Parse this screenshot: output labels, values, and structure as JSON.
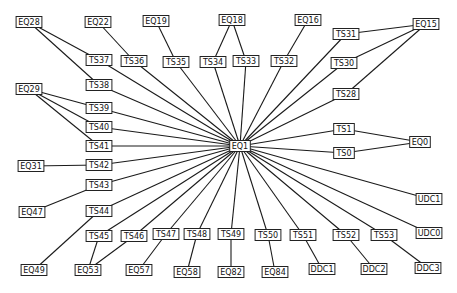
{
  "diagram": {
    "type": "network-topology",
    "center_node": "EQ1",
    "colors": {
      "background": "#ffffff",
      "edge": "#1a1a1a",
      "node_border": "#222222",
      "node_fill": "#ffffff",
      "text": "#111111"
    },
    "nodes": [
      {
        "id": "EQ28",
        "x": 29,
        "y": 22
      },
      {
        "id": "EQ22",
        "x": 98,
        "y": 22
      },
      {
        "id": "EQ19",
        "x": 156,
        "y": 21
      },
      {
        "id": "EQ18",
        "x": 232,
        "y": 20
      },
      {
        "id": "EQ16",
        "x": 308,
        "y": 20
      },
      {
        "id": "EQ15",
        "x": 426,
        "y": 24
      },
      {
        "id": "TS37",
        "x": 99,
        "y": 60
      },
      {
        "id": "TS36",
        "x": 134,
        "y": 61
      },
      {
        "id": "TS35",
        "x": 176,
        "y": 62
      },
      {
        "id": "TS34",
        "x": 213,
        "y": 62
      },
      {
        "id": "TS33",
        "x": 246,
        "y": 61
      },
      {
        "id": "TS32",
        "x": 284,
        "y": 61
      },
      {
        "id": "TS31",
        "x": 346,
        "y": 34
      },
      {
        "id": "TS30",
        "x": 344,
        "y": 63
      },
      {
        "id": "TS28",
        "x": 346,
        "y": 94
      },
      {
        "id": "EQ29",
        "x": 29,
        "y": 89
      },
      {
        "id": "TS38",
        "x": 99,
        "y": 85
      },
      {
        "id": "TS39",
        "x": 99,
        "y": 108
      },
      {
        "id": "TS40",
        "x": 99,
        "y": 127
      },
      {
        "id": "TS41",
        "x": 99,
        "y": 146
      },
      {
        "id": "TS42",
        "x": 99,
        "y": 165
      },
      {
        "id": "EQ31",
        "x": 31,
        "y": 166
      },
      {
        "id": "TS43",
        "x": 99,
        "y": 185
      },
      {
        "id": "EQ1",
        "x": 240,
        "y": 146
      },
      {
        "id": "TS1",
        "x": 344,
        "y": 129
      },
      {
        "id": "TS0",
        "x": 344,
        "y": 153
      },
      {
        "id": "EQ0",
        "x": 420,
        "y": 142
      },
      {
        "id": "EQ47",
        "x": 32,
        "y": 212
      },
      {
        "id": "TS44",
        "x": 99,
        "y": 211
      },
      {
        "id": "UDC1",
        "x": 429,
        "y": 199
      },
      {
        "id": "TS45",
        "x": 99,
        "y": 236
      },
      {
        "id": "TS46",
        "x": 134,
        "y": 236
      },
      {
        "id": "TS47",
        "x": 166,
        "y": 234
      },
      {
        "id": "TS48",
        "x": 197,
        "y": 234
      },
      {
        "id": "TS49",
        "x": 231,
        "y": 234
      },
      {
        "id": "TS50",
        "x": 268,
        "y": 235
      },
      {
        "id": "TS51",
        "x": 303,
        "y": 235
      },
      {
        "id": "TS52",
        "x": 346,
        "y": 235
      },
      {
        "id": "TS53",
        "x": 384,
        "y": 235
      },
      {
        "id": "UDC0",
        "x": 429,
        "y": 233
      },
      {
        "id": "EQ49",
        "x": 34,
        "y": 270
      },
      {
        "id": "EQ53",
        "x": 88,
        "y": 270
      },
      {
        "id": "EQ57",
        "x": 139,
        "y": 270
      },
      {
        "id": "EQ58",
        "x": 187,
        "y": 272
      },
      {
        "id": "EQ82",
        "x": 231,
        "y": 272
      },
      {
        "id": "EQ84",
        "x": 275,
        "y": 272
      },
      {
        "id": "DDC1",
        "x": 322,
        "y": 269
      },
      {
        "id": "DDC2",
        "x": 374,
        "y": 269
      },
      {
        "id": "DDC3",
        "x": 428,
        "y": 268
      }
    ],
    "edges": [
      [
        "EQ28",
        "TS37"
      ],
      [
        "EQ28",
        "TS38"
      ],
      [
        "EQ22",
        "TS36"
      ],
      [
        "EQ19",
        "TS35"
      ],
      [
        "EQ18",
        "TS34"
      ],
      [
        "EQ18",
        "TS33"
      ],
      [
        "EQ16",
        "TS32"
      ],
      [
        "EQ15",
        "TS31"
      ],
      [
        "EQ15",
        "TS30"
      ],
      [
        "EQ15",
        "TS28"
      ],
      [
        "EQ29",
        "TS39"
      ],
      [
        "EQ29",
        "TS40"
      ],
      [
        "EQ29",
        "TS41"
      ],
      [
        "EQ31",
        "TS42"
      ],
      [
        "EQ47",
        "TS43"
      ],
      [
        "EQ49",
        "TS44"
      ],
      [
        "EQ53",
        "TS45"
      ],
      [
        "EQ53",
        "TS46"
      ],
      [
        "EQ57",
        "TS47"
      ],
      [
        "EQ58",
        "TS48"
      ],
      [
        "EQ82",
        "TS49"
      ],
      [
        "EQ84",
        "TS50"
      ],
      [
        "DDC1",
        "TS51"
      ],
      [
        "DDC2",
        "TS52"
      ],
      [
        "DDC3",
        "TS53"
      ],
      [
        "EQ0",
        "TS1"
      ],
      [
        "EQ0",
        "TS0"
      ],
      [
        "EQ1",
        "TS37"
      ],
      [
        "EQ1",
        "TS36"
      ],
      [
        "EQ1",
        "TS35"
      ],
      [
        "EQ1",
        "TS34"
      ],
      [
        "EQ1",
        "TS33"
      ],
      [
        "EQ1",
        "TS32"
      ],
      [
        "EQ1",
        "TS31"
      ],
      [
        "EQ1",
        "TS30"
      ],
      [
        "EQ1",
        "TS28"
      ],
      [
        "EQ1",
        "TS38"
      ],
      [
        "EQ1",
        "TS39"
      ],
      [
        "EQ1",
        "TS40"
      ],
      [
        "EQ1",
        "TS41"
      ],
      [
        "EQ1",
        "TS42"
      ],
      [
        "EQ1",
        "TS43"
      ],
      [
        "EQ1",
        "TS44"
      ],
      [
        "EQ1",
        "TS45"
      ],
      [
        "EQ1",
        "TS46"
      ],
      [
        "EQ1",
        "TS47"
      ],
      [
        "EQ1",
        "TS48"
      ],
      [
        "EQ1",
        "TS49"
      ],
      [
        "EQ1",
        "TS50"
      ],
      [
        "EQ1",
        "TS51"
      ],
      [
        "EQ1",
        "TS52"
      ],
      [
        "EQ1",
        "TS53"
      ],
      [
        "EQ1",
        "TS1"
      ],
      [
        "EQ1",
        "TS0"
      ],
      [
        "EQ1",
        "UDC1"
      ],
      [
        "EQ1",
        "UDC0"
      ]
    ]
  }
}
